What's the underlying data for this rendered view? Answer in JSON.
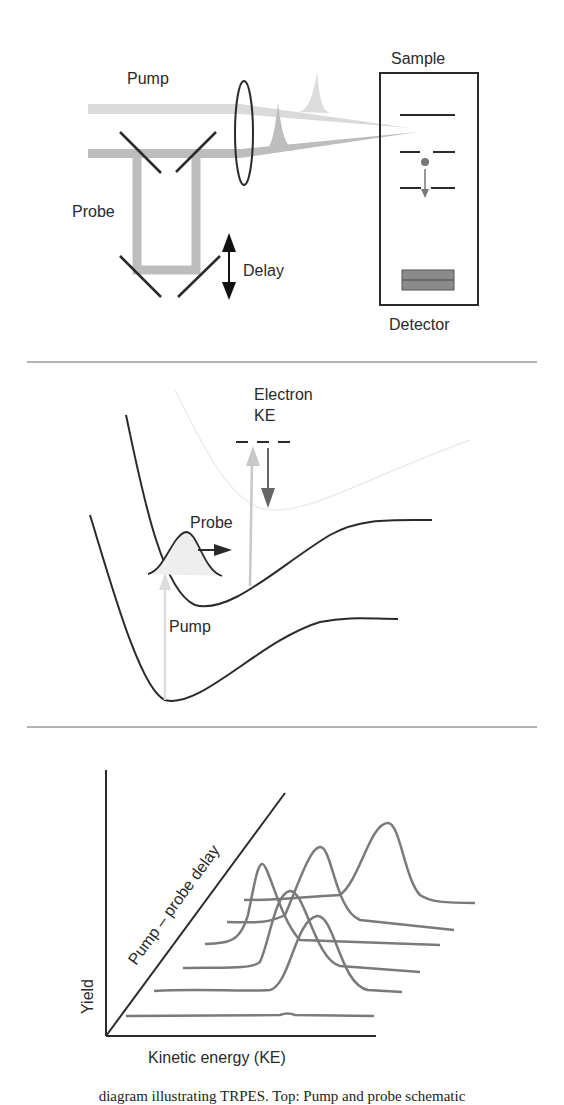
{
  "figure": {
    "panels": {
      "setup": {
        "labels": {
          "pump": "Pump",
          "probe": "Probe",
          "delay": "Delay",
          "sample": "Sample",
          "detector": "Detector"
        }
      },
      "potentials": {
        "labels": {
          "electron_ke_line1": "Electron",
          "electron_ke_line2": "KE",
          "probe": "Probe",
          "pump": "Pump"
        }
      },
      "spectra": {
        "labels": {
          "yield_axis": "Yield",
          "ke_axis": "Kinetic energy (KE)",
          "delay_axis": "Pump – probe delay"
        }
      }
    },
    "caption": "diagram illustrating TRPES. Top: Pump and probe schematic"
  },
  "colors": {
    "pump_beam": "#d8d8d8",
    "probe_beam": "#b8b8b8",
    "ink": "#2a2a2a",
    "curve": "#7a7a7a"
  }
}
